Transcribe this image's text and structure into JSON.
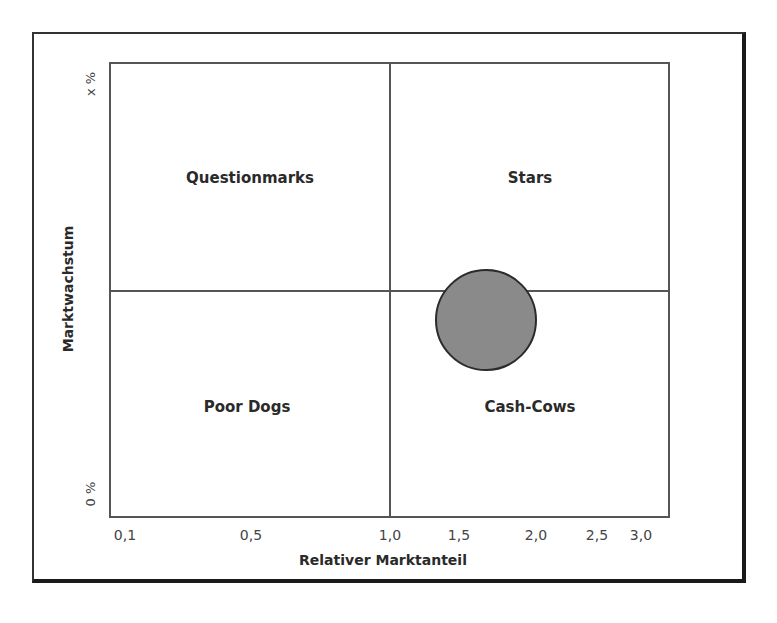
{
  "chart_data": {
    "type": "scatter",
    "subtype": "bubble / BCG portfolio matrix",
    "title": "",
    "xlabel": "Relativer Marktanteil",
    "ylabel": "Marktwachstum",
    "x_ticks": [
      "0,1",
      "0,5",
      "1,0",
      "1,5",
      "2,0",
      "2,5",
      "3,0"
    ],
    "y_ticks": [
      "0 %",
      "x %"
    ],
    "x_scale": "non-linear (log-like)",
    "xlim": [
      0.1,
      3.0
    ],
    "grid": false,
    "quadrant_dividers": {
      "x": 1.0,
      "y": "midpoint"
    },
    "quadrants": [
      {
        "name": "Questionmarks",
        "position": "top-left"
      },
      {
        "name": "Stars",
        "position": "top-right"
      },
      {
        "name": "Poor Dogs",
        "position": "bottom-left"
      },
      {
        "name": "Cash-Cows",
        "position": "bottom-right"
      }
    ],
    "series": [
      {
        "name": "Produkt",
        "points": [
          {
            "x": 1.6,
            "y_relative": 0.44,
            "size": "large",
            "color": "#8a8a8a"
          }
        ]
      }
    ],
    "legend": "none"
  },
  "labels": {
    "q_tl": "Questionmarks",
    "q_tr": "Stars",
    "q_bl": "Poor Dogs",
    "q_br": "Cash-Cows",
    "xlabel": "Relativer Marktanteil",
    "ylabel": "Marktwachstum",
    "ytick_top": "x %",
    "ytick_bottom": "0 %",
    "xticks": [
      "0,1",
      "0,5",
      "1,0",
      "1,5",
      "2,0",
      "2,5",
      "3,0"
    ]
  },
  "layout": {
    "xtick_px": [
      125,
      251,
      390,
      459,
      536,
      597,
      641
    ],
    "bubble": {
      "cx": 486,
      "cy": 320,
      "r": 51,
      "fill": "#8a8a8a"
    }
  }
}
